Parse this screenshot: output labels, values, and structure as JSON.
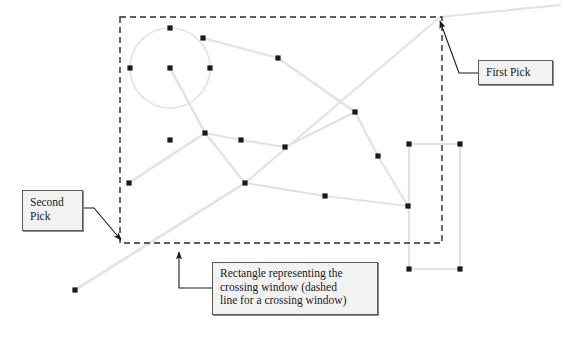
{
  "figure": {
    "type": "cad-selection-diagram",
    "background_color": "#ffffff"
  },
  "colors": {
    "entity_line": "#e2e2e2",
    "point_marker": "#1a1a1a",
    "dashed_window": "#2b2b2b",
    "leader_line": "#1a1a1a",
    "box_fill": "#f2f2f2",
    "box_border": "#5a5a5a",
    "text": "#1a1a1a"
  },
  "callouts": {
    "first_pick": {
      "label": "First Pick",
      "box": {
        "x": 478,
        "y": 60,
        "w": 75,
        "h": 25
      },
      "leader_from": {
        "x": 478,
        "y": 73
      },
      "leader_elbow": {
        "x": 459,
        "y": 73
      },
      "arrow_to": {
        "x": 440,
        "y": 21
      }
    },
    "second_pick": {
      "label": "Second\nPick",
      "box": {
        "x": 22,
        "y": 190,
        "w": 61,
        "h": 41
      },
      "leader_from": {
        "x": 83,
        "y": 208
      },
      "leader_elbow": {
        "x": 94,
        "y": 208
      },
      "arrow_to": {
        "x": 121,
        "y": 240
      }
    },
    "crossing_window": {
      "label": "Rectangle representing the\ncrossing window (dashed\nline for a crossing window)",
      "box": {
        "x": 212,
        "y": 262,
        "w": 166,
        "h": 53
      },
      "leader_from": {
        "x": 212,
        "y": 288
      },
      "leader_elbow": {
        "x": 179,
        "y": 288
      },
      "arrow_to": {
        "x": 179,
        "y": 252
      }
    }
  },
  "crossing_window_rect": {
    "name": "crossing-window",
    "x": 120,
    "y": 17,
    "width": 322,
    "height": 226,
    "stroke_dasharray": "6 4",
    "stroke_width": 1.4
  },
  "chart_data": {
    "type": "scatter",
    "title": "",
    "circle": {
      "cx": 170,
      "cy": 68,
      "r": 40
    },
    "points": [
      {
        "id": "p1",
        "x": 170,
        "y": 28
      },
      {
        "id": "p2",
        "x": 203,
        "y": 38
      },
      {
        "id": "p3",
        "x": 130,
        "y": 68
      },
      {
        "id": "p4",
        "x": 170,
        "y": 68
      },
      {
        "id": "p5",
        "x": 210,
        "y": 68
      },
      {
        "id": "p6",
        "x": 278,
        "y": 58
      },
      {
        "id": "p7",
        "x": 355,
        "y": 112
      },
      {
        "id": "p8",
        "x": 205,
        "y": 133
      },
      {
        "id": "p9",
        "x": 170,
        "y": 140
      },
      {
        "id": "p10",
        "x": 241,
        "y": 140
      },
      {
        "id": "p11",
        "x": 285,
        "y": 147
      },
      {
        "id": "p12",
        "x": 378,
        "y": 156
      },
      {
        "id": "p13",
        "x": 129,
        "y": 183
      },
      {
        "id": "p14",
        "x": 245,
        "y": 183
      },
      {
        "id": "p15",
        "x": 325,
        "y": 196
      },
      {
        "id": "p16",
        "x": 408,
        "y": 206
      },
      {
        "id": "p17",
        "x": 409,
        "y": 144
      },
      {
        "id": "p18",
        "x": 460,
        "y": 144
      },
      {
        "id": "p19",
        "x": 409,
        "y": 269
      },
      {
        "id": "p20",
        "x": 460,
        "y": 269
      },
      {
        "id": "p21",
        "x": 75,
        "y": 290
      }
    ],
    "polylines": [
      {
        "id": "l1",
        "points": "203,38 278,58 355,112 378,156 408,206"
      },
      {
        "id": "l2",
        "points": "170,68 205,133 245,183 75,290"
      },
      {
        "id": "l3",
        "points": "129,183 205,133 170,68"
      },
      {
        "id": "l4",
        "points": "205,133 241,140 285,147 355,112"
      },
      {
        "id": "l5",
        "points": "245,183 325,196 408,206"
      },
      {
        "id": "l6",
        "points": "75,290 245,183 440,17 560,5"
      },
      {
        "id": "l7",
        "points": "409,144 460,144 460,269 409,269 409,144"
      }
    ]
  }
}
